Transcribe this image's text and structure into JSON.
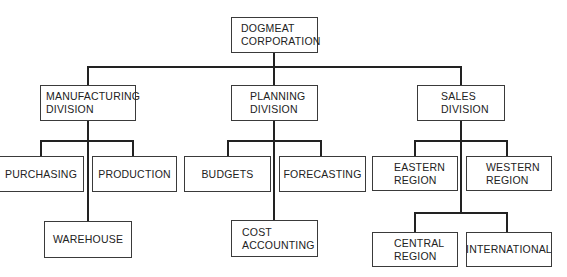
{
  "chart_title": "",
  "nodes": {
    "root": {
      "lines": [
        "DOGMEAT",
        "CORPORATION"
      ]
    },
    "manufacturing": {
      "lines": [
        "MANUFACTURING",
        "DIVISION"
      ]
    },
    "planning": {
      "lines": [
        "PLANNING",
        "DIVISION"
      ]
    },
    "sales": {
      "lines": [
        "SALES",
        "DIVISION"
      ]
    },
    "purchasing": {
      "lines": [
        "PURCHASING"
      ]
    },
    "production": {
      "lines": [
        "PRODUCTION"
      ]
    },
    "warehouse": {
      "lines": [
        "WAREHOUSE"
      ]
    },
    "budgets": {
      "lines": [
        "BUDGETS"
      ]
    },
    "forecasting": {
      "lines": [
        "FORECASTING"
      ]
    },
    "cost_accounting": {
      "lines": [
        "COST",
        "ACCOUNTING"
      ]
    },
    "eastern": {
      "lines": [
        "EASTERN",
        "REGION"
      ]
    },
    "western": {
      "lines": [
        "WESTERN",
        "REGION"
      ]
    },
    "central": {
      "lines": [
        "CENTRAL",
        "REGION"
      ]
    },
    "international": {
      "lines": [
        "INTERNATIONAL"
      ]
    }
  },
  "hierarchy": {
    "DOGMEAT CORPORATION": {
      "MANUFACTURING DIVISION": [
        "PURCHASING",
        "PRODUCTION",
        "WAREHOUSE"
      ],
      "PLANNING DIVISION": [
        "BUDGETS",
        "FORECASTING",
        "COST ACCOUNTING"
      ],
      "SALES DIVISION": [
        "EASTERN REGION",
        "WESTERN REGION",
        "CENTRAL REGION",
        "INTERNATIONAL"
      ]
    }
  },
  "colors": {
    "line": "#222222",
    "border": "#3a3a3a",
    "text": "#222222",
    "background": "#ffffff"
  }
}
